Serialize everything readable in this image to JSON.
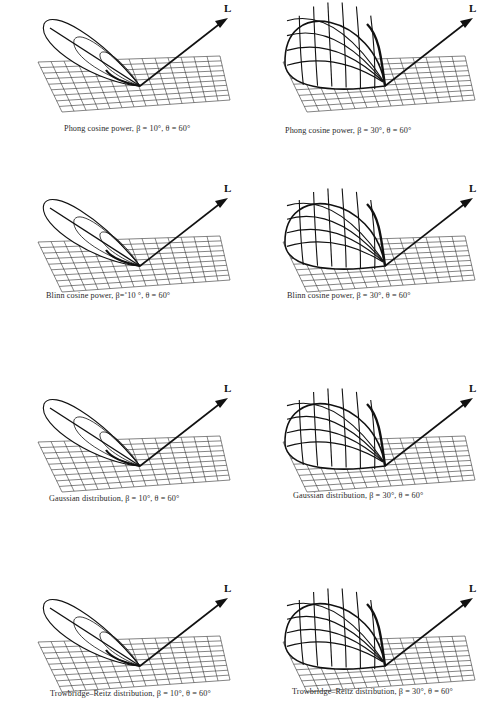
{
  "figure": {
    "light_label": "L",
    "panels": [
      {
        "id": "phong-10",
        "model": "Phong cosine power",
        "beta": "10",
        "theta": "60",
        "caption": "Phong cosine power,   β = 10°,  θ = 60°",
        "lobe": "narrow",
        "pos": {
          "x": 20,
          "y": 0
        },
        "caption_pos": {
          "x": 44,
          "y": 124
        }
      },
      {
        "id": "phong-30",
        "model": "Phong cosine power",
        "beta": "30",
        "theta": "60",
        "caption": "Phong cosine power,   β = 30°,  θ = 60°",
        "lobe": "dome",
        "pos": {
          "x": 265,
          "y": 0
        },
        "caption_pos": {
          "x": 20,
          "y": 126
        }
      },
      {
        "id": "blinn-10",
        "model": "Blinn cosine power",
        "beta": "˚10",
        "theta": "60",
        "caption": "Blinn cosine power,  β=˚10 °,  θ = 60°",
        "lobe": "narrow",
        "pos": {
          "x": 20,
          "y": 180
        },
        "caption_pos": {
          "x": 26,
          "y": 111
        }
      },
      {
        "id": "blinn-30",
        "model": "Blinn cosine power",
        "beta": "30",
        "theta": "60",
        "caption": "Blinn cosine power,  β = 30°,  θ = 60°",
        "lobe": "wide",
        "pos": {
          "x": 265,
          "y": 180
        },
        "caption_pos": {
          "x": 22,
          "y": 111
        }
      },
      {
        "id": "gaussian-10",
        "model": "Gaussian distribution",
        "beta": "10",
        "theta": "60",
        "caption": "Gaussian distribution,  β = 10°,  θ = 60°",
        "lobe": "narrow",
        "pos": {
          "x": 20,
          "y": 380
        },
        "caption_pos": {
          "x": 29,
          "y": 114
        }
      },
      {
        "id": "gaussian-30",
        "model": "Gaussian distribution",
        "beta": "30",
        "theta": "60",
        "caption": "Gaussian distribution,  β = 30°,  θ = 60°",
        "lobe": "wide",
        "pos": {
          "x": 265,
          "y": 380
        },
        "caption_pos": {
          "x": 28,
          "y": 111
        }
      },
      {
        "id": "tr-10",
        "model": "Trowbridge–Reitz distribution",
        "beta": "10",
        "theta": "60",
        "caption": "Trowbridge–Reitz distribution,   β = 10°,  θ = 60°",
        "lobe": "narrow",
        "pos": {
          "x": 20,
          "y": 580
        },
        "caption_pos": {
          "x": 30,
          "y": 109
        }
      },
      {
        "id": "tr-30",
        "model": "Trowbridge–Reitz distribution",
        "beta": "30",
        "theta": "60",
        "caption": "Trowbridge–Reitz distribution,   β = 30°,  θ = 60°",
        "lobe": "wide",
        "pos": {
          "x": 265,
          "y": 580
        },
        "caption_pos": {
          "x": 27,
          "y": 107
        }
      }
    ]
  },
  "chart_data": {
    "type": "figure-grid",
    "title": "",
    "layout": {
      "rows": 4,
      "cols": 2
    },
    "parameter_theta_deg": 60,
    "panels": [
      {
        "model": "Phong cosine power",
        "beta_deg": 10,
        "theta_deg": 60
      },
      {
        "model": "Phong cosine power",
        "beta_deg": 30,
        "theta_deg": 60
      },
      {
        "model": "Blinn cosine power",
        "beta_deg": 10,
        "theta_deg": 60
      },
      {
        "model": "Blinn cosine power",
        "beta_deg": 30,
        "theta_deg": 60
      },
      {
        "model": "Gaussian distribution",
        "beta_deg": 10,
        "theta_deg": 60
      },
      {
        "model": "Gaussian distribution",
        "beta_deg": 30,
        "theta_deg": 60
      },
      {
        "model": "Trowbridge–Reitz distribution",
        "beta_deg": 10,
        "theta_deg": 60
      },
      {
        "model": "Trowbridge–Reitz distribution",
        "beta_deg": 30,
        "theta_deg": 60
      }
    ],
    "annotations": [
      "L (light direction vector)"
    ]
  }
}
